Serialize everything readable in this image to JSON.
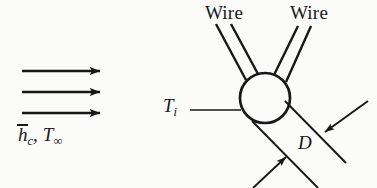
{
  "figure": {
    "background_color": "#fbfbfa",
    "ink_color": "#17171a",
    "labels": {
      "wire_left": "Wire",
      "wire_right": "Wire",
      "bead_temperature": "T",
      "bead_temperature_subscript": "i",
      "diameter": "D",
      "flow_coefficient": "h",
      "flow_coefficient_subscript": "c",
      "flow_separator": ",",
      "flow_temperature": "T",
      "flow_temperature_subscript": "∞"
    },
    "flow_arrows": {
      "count": 3,
      "direction": "right",
      "x_start": 22,
      "x_end": 106,
      "y_positions": [
        71,
        92,
        113
      ]
    },
    "bead": {
      "shape": "circle",
      "center_x": 265,
      "center_y": 98,
      "radius": 25,
      "stroke_width": 2.6
    },
    "dimension": {
      "label": "D",
      "arrow_count": 2,
      "style": "inward-pointing-arrows-between-parallel-extension-lines"
    }
  }
}
